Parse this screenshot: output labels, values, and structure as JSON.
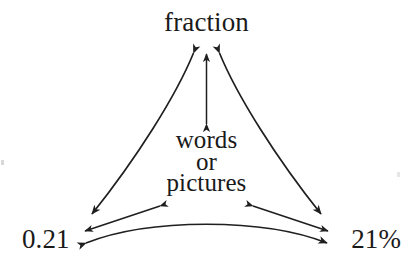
{
  "figure": {
    "background_color": "#ffffff",
    "ink_color": "#1a1a1a",
    "width": 413,
    "height": 265
  },
  "nodes": {
    "top": {
      "id": "fraction",
      "label": "fraction",
      "position": "top-apex"
    },
    "center": {
      "id": "words-or-pictures",
      "lines": [
        "words",
        "or",
        "pictures"
      ],
      "line1": "words",
      "line2": "or",
      "line3": "pictures",
      "position": "center"
    },
    "bottom_left": {
      "id": "decimal",
      "label": "0.21",
      "position": "bottom-left-vertex"
    },
    "bottom_right": {
      "id": "percent",
      "label": "21%",
      "position": "bottom-right-vertex"
    }
  },
  "connectors": [
    {
      "name": "curve-fraction-to-decimal",
      "from": "fraction",
      "to": "0.21",
      "style": "curved",
      "curvature": "concave-inward",
      "arrowheads": "both-ends"
    },
    {
      "name": "curve-fraction-to-percent",
      "from": "fraction",
      "to": "21%",
      "style": "curved",
      "curvature": "concave-inward",
      "arrowheads": "both-ends"
    },
    {
      "name": "curve-decimal-to-percent",
      "from": "0.21",
      "to": "21%",
      "style": "curved",
      "curvature": "concave-inward",
      "arrowheads": "both-ends"
    },
    {
      "name": "straight-center-to-fraction",
      "from": "words or pictures",
      "to": "fraction",
      "style": "straight",
      "arrowheads": "both-ends"
    },
    {
      "name": "straight-center-to-decimal",
      "from": "words or pictures",
      "to": "0.21",
      "style": "straight",
      "arrowheads": "both-ends"
    },
    {
      "name": "straight-center-to-percent",
      "from": "words or pictures",
      "to": "21%",
      "style": "straight",
      "arrowheads": "both-ends"
    }
  ],
  "artifacts": {
    "left_speck": "scan-speck",
    "right_speck": "scan-speck"
  }
}
